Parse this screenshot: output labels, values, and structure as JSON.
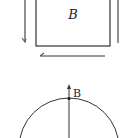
{
  "figure_top": {
    "square_label": "B",
    "arrows": [
      "left-side-down",
      "bottom-left"
    ],
    "right_line": "vertical-line"
  },
  "figure_bottom": {
    "point_label": "B",
    "shape": "circle",
    "vector": "upward-arrow"
  },
  "colors": {
    "stroke": "#333333",
    "arrow_gray": "#666666"
  }
}
